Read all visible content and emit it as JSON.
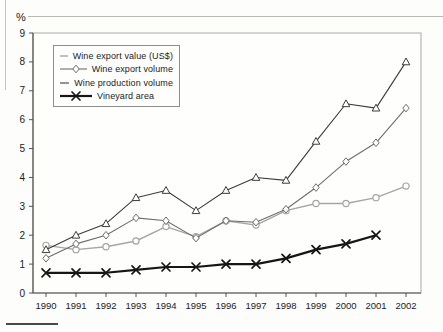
{
  "chart_data": {
    "type": "line",
    "title": "",
    "xlabel": "",
    "ylabel": "%",
    "ylim": [
      0,
      9
    ],
    "yticks": [
      0,
      1,
      2,
      3,
      4,
      5,
      6,
      7,
      8,
      9
    ],
    "grid": false,
    "legend_position": "top-left",
    "categories": [
      "1990",
      "1991",
      "1992",
      "1993",
      "1994",
      "1995",
      "1996",
      "1997",
      "1998",
      "1999",
      "2000",
      "2001",
      "2002"
    ],
    "series": [
      {
        "name": "Wine export value (US$)",
        "marker": "circle",
        "color": "#a6a6a3",
        "line_width": 1.4,
        "values": [
          1.65,
          1.5,
          1.6,
          1.8,
          2.3,
          1.95,
          2.5,
          2.35,
          2.85,
          3.1,
          3.1,
          3.3,
          3.7
        ]
      },
      {
        "name": "Wine export volume",
        "marker": "diamond",
        "color": "#6e6e6a",
        "line_width": 1.1,
        "values": [
          1.2,
          1.7,
          2.0,
          2.6,
          2.5,
          1.9,
          2.5,
          2.45,
          2.9,
          3.65,
          4.55,
          5.2,
          6.4
        ]
      },
      {
        "name": "Wine production volume",
        "marker": "triangle",
        "color": "#3c3c39",
        "line_width": 1.1,
        "values": [
          1.5,
          2.0,
          2.4,
          3.3,
          3.55,
          2.85,
          3.55,
          4.0,
          3.9,
          5.25,
          6.55,
          6.4,
          8.0
        ]
      },
      {
        "name": "Vineyard area",
        "marker": "x",
        "color": "#161614",
        "line_width": 2.2,
        "values": [
          0.7,
          0.7,
          0.7,
          0.8,
          0.9,
          0.9,
          1.0,
          1.0,
          1.2,
          1.5,
          1.7,
          2.0,
          null
        ]
      }
    ]
  }
}
